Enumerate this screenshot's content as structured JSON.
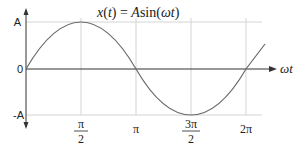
{
  "title_parts": {
    "lhs": "x(t) = ",
    "A": "A",
    "func": "sin(ωt)"
  },
  "y_axis": {
    "labels": [
      "A",
      "0",
      "-A"
    ]
  },
  "x_axis": {
    "label": "ωt",
    "ticks": [
      {
        "num": "π",
        "den": "2"
      },
      {
        "num": "π",
        "den": ""
      },
      {
        "num": "3π",
        "den": "2"
      },
      {
        "num": "2π",
        "den": ""
      }
    ]
  },
  "colors": {
    "axis": "#333333",
    "curve": "#666666",
    "grid": "#cccccc",
    "text": "#222222"
  },
  "curve": {
    "function": "A sin(ωt)",
    "domain_start": 0,
    "domain_end_approx": "2π + 0.3π"
  }
}
